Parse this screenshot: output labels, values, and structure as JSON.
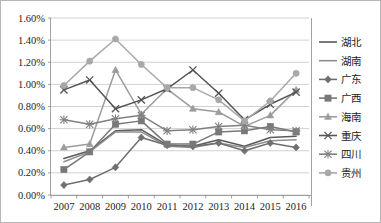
{
  "chart_data": {
    "type": "line",
    "title": "",
    "xlabel": "",
    "ylabel": "",
    "categories": [
      "2007",
      "2008",
      "2009",
      "2010",
      "2011",
      "2012",
      "2013",
      "2014",
      "2015",
      "2016"
    ],
    "x_tick_labels": [
      "2007",
      "2008",
      "2009",
      "2010",
      "2011",
      "2012",
      "2013",
      "2014",
      "2015",
      "2016"
    ],
    "y_tick_labels": [
      "0.00%",
      "0.20%",
      "0.40%",
      "0.60%",
      "0.80%",
      "1.00%",
      "1.20%",
      "1.40%",
      "1.60%"
    ],
    "y_tick_values": [
      0.0,
      0.2,
      0.4,
      0.6,
      0.8,
      1.0,
      1.2,
      1.4,
      1.6
    ],
    "ylim": [
      0.0,
      1.6
    ],
    "grid": true,
    "legend_position": "right",
    "units": "percent",
    "series": [
      {
        "name": "湖北",
        "color": "#5a5a5a",
        "marker": "none",
        "values": [
          0.33,
          0.4,
          0.58,
          0.59,
          0.45,
          0.44,
          0.5,
          0.44,
          0.52,
          0.53
        ]
      },
      {
        "name": "湖南",
        "color": "#8e8e8e",
        "marker": "none",
        "values": [
          0.3,
          0.39,
          0.57,
          0.57,
          0.44,
          0.43,
          0.47,
          0.43,
          0.49,
          0.5
        ]
      },
      {
        "name": "广东",
        "color": "#6f6f6f",
        "marker": "diamond",
        "values": [
          0.09,
          0.14,
          0.25,
          0.52,
          0.45,
          0.44,
          0.47,
          0.4,
          0.47,
          0.43
        ]
      },
      {
        "name": "广西",
        "color": "#787878",
        "marker": "square",
        "values": [
          0.23,
          0.39,
          0.64,
          0.67,
          0.46,
          0.46,
          0.57,
          0.58,
          0.62,
          0.57
        ]
      },
      {
        "name": "海南",
        "color": "#9c9c9c",
        "marker": "triangle",
        "values": [
          0.43,
          0.46,
          1.13,
          0.73,
          0.96,
          0.78,
          0.75,
          0.62,
          0.72,
          0.95
        ]
      },
      {
        "name": "重庆",
        "color": "#545454",
        "marker": "cross",
        "values": [
          0.95,
          1.04,
          0.78,
          0.86,
          0.96,
          1.13,
          0.92,
          0.68,
          0.82,
          0.93
        ]
      },
      {
        "name": "四川",
        "color": "#808080",
        "marker": "star",
        "values": [
          0.68,
          0.64,
          0.69,
          0.72,
          0.58,
          0.59,
          0.62,
          0.63,
          0.59,
          0.58
        ]
      },
      {
        "name": "贵州",
        "color": "#a8a8a8",
        "marker": "circle",
        "values": [
          0.99,
          1.21,
          1.41,
          1.18,
          0.97,
          0.97,
          0.86,
          0.67,
          0.85,
          1.1
        ]
      }
    ]
  },
  "legend": {
    "items": [
      {
        "label": "湖北"
      },
      {
        "label": "湖南"
      },
      {
        "label": "广东"
      },
      {
        "label": "广西"
      },
      {
        "label": "海南"
      },
      {
        "label": "重庆"
      },
      {
        "label": "四川"
      },
      {
        "label": "贵州"
      }
    ]
  }
}
